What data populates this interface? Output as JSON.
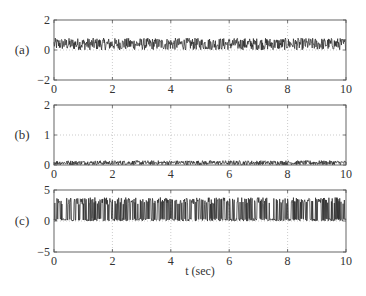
{
  "chart_data": [
    {
      "type": "line",
      "panel_label": "(a)",
      "title": "",
      "xlabel": "",
      "ylabel": "",
      "xlim": [
        0,
        10
      ],
      "ylim": [
        -2,
        2
      ],
      "xticks": [
        0,
        2,
        4,
        6,
        8,
        10
      ],
      "yticks": [
        -2,
        0,
        2
      ],
      "ytick_labels": [
        "−2",
        "0",
        "2"
      ],
      "grid": true,
      "description": "dense oscillating signal between approx 0 and 0.8",
      "signal_min": 0.0,
      "signal_max": 0.8,
      "series": [
        {
          "name": "signal-a",
          "color": "#222222"
        }
      ]
    },
    {
      "type": "line",
      "panel_label": "(b)",
      "title": "",
      "xlabel": "",
      "ylabel": "",
      "xlim": [
        0,
        10
      ],
      "ylim": [
        0,
        2
      ],
      "xticks": [
        0,
        2,
        4,
        6,
        8,
        10
      ],
      "yticks": [
        0,
        1,
        2
      ],
      "ytick_labels": [
        "0",
        "1",
        "2"
      ],
      "grid": true,
      "description": "dense oscillating signal between approx 0 and 0.15",
      "signal_min": 0.0,
      "signal_max": 0.15,
      "series": [
        {
          "name": "signal-b",
          "color": "#222222"
        }
      ]
    },
    {
      "type": "line",
      "panel_label": "(c)",
      "title": "",
      "xlabel": "t (sec)",
      "ylabel": "",
      "xlim": [
        0,
        10
      ],
      "ylim": [
        -5,
        5
      ],
      "xticks": [
        0,
        2,
        4,
        6,
        8,
        10
      ],
      "yticks": [
        -5,
        0,
        5
      ],
      "ytick_labels": [
        "−5",
        "0",
        "5"
      ],
      "grid": true,
      "description": "dense switching signal between approx 0 and 3.8",
      "signal_min": 0.0,
      "signal_max": 3.8,
      "series": [
        {
          "name": "signal-c",
          "color": "#222222"
        }
      ]
    }
  ],
  "labels": {
    "panel_a": "(a)",
    "panel_b": "(b)",
    "panel_c": "(c)",
    "xlabel": "t (sec)"
  },
  "colors": {
    "axis": "#555555",
    "grid": "#aaaaaa",
    "signal": "#222222"
  }
}
